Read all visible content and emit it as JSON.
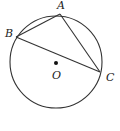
{
  "diagram": {
    "type": "circle-inscribed-triangle",
    "circle": {
      "cx": 56,
      "cy": 62,
      "r": 46,
      "stroke": "#333333"
    },
    "center": {
      "label": "O",
      "x": 56,
      "y": 62
    },
    "points": [
      {
        "label": "A",
        "x": 60,
        "y": 14
      },
      {
        "label": "B",
        "x": 16,
        "y": 37
      },
      {
        "label": "C",
        "x": 100,
        "y": 72
      }
    ],
    "segments": [
      "AB",
      "AC",
      "BC"
    ],
    "labels": {
      "A": "A",
      "B": "B",
      "C": "C",
      "O": "O"
    }
  }
}
